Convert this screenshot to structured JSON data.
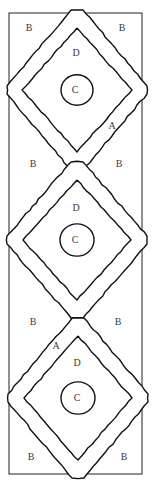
{
  "diagram": {
    "type": "braided-diamond-chain",
    "stroke_color": "#111111",
    "background": "#ffffff",
    "frame": {
      "x": 9,
      "y": 13,
      "width": 133,
      "height": 461
    },
    "diamonds": [
      {
        "id": "upper",
        "center": [
          77,
          90
        ],
        "outer_half_w": 70,
        "outer_half_h": 80,
        "inner_half_w": 55,
        "inner_half_h": 62,
        "circle_r": 16,
        "label_D": "D",
        "label_C": "C"
      },
      {
        "id": "middle",
        "center": [
          77,
          240
        ],
        "outer_half_w": 70,
        "outer_half_h": 78,
        "inner_half_w": 54,
        "inner_half_h": 60,
        "circle_r": 17,
        "label_D": "D",
        "label_C": "C"
      },
      {
        "id": "lower",
        "center": [
          78,
          398
        ],
        "outer_half_w": 70,
        "outer_half_h": 80,
        "inner_half_w": 54,
        "inner_half_h": 62,
        "circle_r": 17,
        "label_D": "D",
        "label_C": "C"
      }
    ],
    "labels": [
      {
        "text": "B",
        "x": 29,
        "y": 28
      },
      {
        "text": "B",
        "x": 122,
        "y": 28
      },
      {
        "text": "D",
        "x": 76,
        "y": 53
      },
      {
        "text": "C",
        "x": 75,
        "y": 90
      },
      {
        "text": "A",
        "x": 112,
        "y": 126
      },
      {
        "text": "B",
        "x": 33,
        "y": 164
      },
      {
        "text": "B",
        "x": 119,
        "y": 164
      },
      {
        "text": "D",
        "x": 76,
        "y": 208
      },
      {
        "text": "C",
        "x": 75,
        "y": 240
      },
      {
        "text": "B",
        "x": 33,
        "y": 322
      },
      {
        "text": "B",
        "x": 118,
        "y": 322
      },
      {
        "text": "A",
        "x": 56,
        "y": 346
      },
      {
        "text": "D",
        "x": 77,
        "y": 363
      },
      {
        "text": "C",
        "x": 77,
        "y": 398
      },
      {
        "text": "B",
        "x": 31,
        "y": 457
      },
      {
        "text": "B",
        "x": 124,
        "y": 457
      }
    ]
  }
}
